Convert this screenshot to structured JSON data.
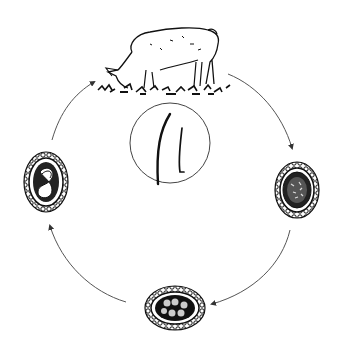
{
  "diagram": {
    "title": "Pig roundworm life cycle",
    "colors": {
      "background": "#ffffff",
      "ink": "#111111",
      "arrow": "#555555",
      "circle": "#444444"
    },
    "nodes": [
      {
        "id": "pig",
        "label": "Pig host (grazing)",
        "position": "top-center"
      },
      {
        "id": "adult-worms",
        "label": "Adult worms",
        "position": "center"
      },
      {
        "id": "egg-unembryonated",
        "label": "Unembryonated egg",
        "position": "right"
      },
      {
        "id": "egg-cleaving",
        "label": "Egg with cleaving cells",
        "position": "bottom"
      },
      {
        "id": "egg-larvated",
        "label": "Egg containing larva",
        "position": "left"
      }
    ],
    "edges": [
      {
        "from": "pig",
        "to": "egg-unembryonated",
        "direction": "clockwise"
      },
      {
        "from": "egg-unembryonated",
        "to": "egg-cleaving",
        "direction": "clockwise"
      },
      {
        "from": "egg-cleaving",
        "to": "egg-larvated",
        "direction": "clockwise"
      },
      {
        "from": "egg-larvated",
        "to": "pig",
        "direction": "clockwise"
      }
    ]
  }
}
